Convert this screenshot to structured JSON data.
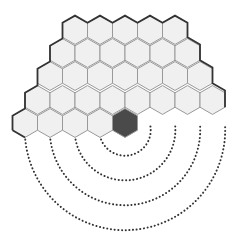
{
  "diagram": {
    "type": "hex-board-with-wraparound",
    "hex": {
      "width": 25,
      "row_step": 23.3,
      "fill": "#f0f0f0",
      "stroke": "#999999",
      "outline": "#333333"
    },
    "highlight": {
      "fill": "#4a4a4a",
      "row": 4,
      "col": 4
    },
    "rows": [
      {
        "y": 30,
        "x0": 75,
        "count": 5
      },
      {
        "y": 53,
        "x0": 62.5,
        "count": 6
      },
      {
        "y": 76,
        "x0": 50,
        "count": 7
      },
      {
        "y": 100,
        "x0": 37.5,
        "count": 8
      },
      {
        "y": 123,
        "x0": 25,
        "count": 5
      }
    ],
    "arcs": {
      "center_x": 125,
      "start_y": 136,
      "radii": [
        25,
        50,
        75,
        100
      ],
      "color": "#333333"
    }
  }
}
